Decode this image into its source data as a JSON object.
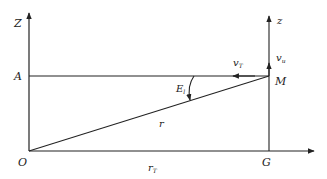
{
  "diagram": {
    "labels": {
      "Z": "Z",
      "A": "A",
      "O": "O",
      "z": "z",
      "M": "M",
      "G": "G",
      "vT": "v",
      "vT_sub": "T",
      "vu": "v",
      "vu_sub": "u",
      "E": "E",
      "E_sub": "l",
      "r": "r",
      "rT": "r",
      "rT_sub": "T"
    },
    "colors": {
      "stroke": "#222222",
      "background": "#ffffff"
    }
  }
}
